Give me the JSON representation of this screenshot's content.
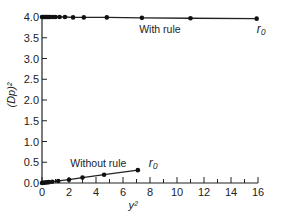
{
  "chart_data": {
    "type": "line",
    "title": "",
    "xlabel": "y²",
    "ylabel": "(Dp)²",
    "xlim": [
      0,
      16
    ],
    "ylim": [
      0,
      4.0
    ],
    "grid": false,
    "legend": "none",
    "x_ticks": [
      0,
      2,
      4,
      6,
      8,
      10,
      12,
      14,
      16
    ],
    "y_ticks": [
      0.0,
      0.5,
      1.0,
      1.5,
      2.0,
      2.5,
      3.0,
      3.5,
      4.0
    ],
    "x_tick_labels": [
      "0",
      "2",
      "4",
      "6",
      "8",
      "10",
      "12",
      "14",
      "16"
    ],
    "y_tick_labels": [
      "0.0",
      "0.5",
      "1.0",
      "1.5",
      "2.0",
      "2.5",
      "3.0",
      "3.5",
      "4.0"
    ],
    "series": [
      {
        "name": "With rule",
        "x": [
          0,
          0.1,
          0.2,
          0.3,
          0.4,
          0.5,
          0.6,
          0.8,
          1.0,
          1.3,
          1.7,
          2.3,
          3.1,
          4.8,
          7.4,
          11.0,
          15.9
        ],
        "y": [
          4.0,
          4.0,
          4.0,
          4.0,
          4.0,
          4.0,
          4.0,
          4.0,
          4.0,
          4.0,
          4.0,
          3.99,
          3.99,
          3.99,
          3.98,
          3.97,
          3.96
        ],
        "end_annotation": "r₀"
      },
      {
        "name": "Without rule",
        "x": [
          0,
          0.1,
          0.2,
          0.35,
          0.5,
          0.75,
          1.2,
          2.0,
          3.0,
          4.6,
          7.1
        ],
        "y": [
          0.0,
          0.005,
          0.01,
          0.015,
          0.02,
          0.03,
          0.05,
          0.08,
          0.13,
          0.2,
          0.31
        ],
        "end_annotation": "r₀"
      }
    ],
    "annotations": [
      {
        "text": "With rule",
        "x": 7.2,
        "y": 3.72
      },
      {
        "text": "Without rule",
        "x": 2.1,
        "y": 0.48
      },
      {
        "text": "r₀",
        "x": 15.9,
        "y": 3.72
      },
      {
        "text": "r₀",
        "x": 7.9,
        "y": 0.48
      }
    ]
  }
}
